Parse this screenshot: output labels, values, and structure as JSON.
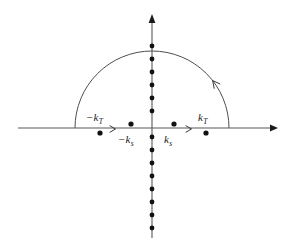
{
  "figure": {
    "type": "complex-plane-contour-diagram",
    "background_color": "#ffffff",
    "ink_color": "#1a1a1a",
    "axis_color": "#58585a"
  },
  "axes": {
    "real_axis": {
      "name": "real-axis",
      "orientation": "horizontal",
      "y": 128,
      "x_start": 18,
      "x_end": 278,
      "arrow_at": "right",
      "label": ""
    },
    "imaginary_axis": {
      "name": "imaginary-axis",
      "orientation": "vertical",
      "x": 152,
      "y_start": 238,
      "y_end": 14,
      "arrow_at": "top",
      "label": ""
    },
    "origin": {
      "x": 152,
      "y": 128
    }
  },
  "contour": {
    "name": "semicircular-contour",
    "shape": "upper-half-semicircle",
    "center_x": 152,
    "center_y": 128,
    "radius": 77,
    "direction": "counterclockwise",
    "arrow_angle_deg": 38,
    "closes_on": "real-axis"
  },
  "poles": [
    {
      "id": "neg-kT",
      "label": "−k",
      "sub": "T",
      "x": 100,
      "y": 133,
      "side": "below-axis",
      "label_x": 86,
      "label_y": 112
    },
    {
      "id": "neg-ks",
      "label": "−k",
      "sub": "s",
      "x": 131,
      "y": 124,
      "side": "above-axis",
      "label_x": 118,
      "label_y": 134
    },
    {
      "id": "pos-ks",
      "label": "k",
      "sub": "s",
      "x": 174,
      "y": 124,
      "side": "above-axis",
      "label_x": 164,
      "label_y": 134
    },
    {
      "id": "pos-kT",
      "label": "k",
      "sub": "T",
      "x": 206,
      "y": 133,
      "side": "below-axis",
      "label_x": 198,
      "label_y": 112
    }
  ],
  "labels": {
    "neg_kT": "−k",
    "neg_kT_sub": "T",
    "neg_ks": "−k",
    "neg_ks_sub": "s",
    "pos_ks": "k",
    "pos_ks_sub": "s",
    "pos_kT": "k",
    "pos_kT_sub": "T"
  },
  "imaginary_axis_dots": {
    "name": "branch-cut-poles",
    "x": 152,
    "spacing": 13,
    "radius": 2.4,
    "upper_y": [
      111,
      98,
      85,
      72,
      59,
      46
    ],
    "lower_y": [
      137,
      150,
      163,
      176,
      189,
      202,
      215,
      228
    ]
  },
  "direction_markers": [
    {
      "id": "left-real-direction",
      "x": 114,
      "y": 129,
      "points": "right"
    },
    {
      "id": "right-real-direction",
      "x": 190,
      "y": 129,
      "points": "right"
    }
  ]
}
